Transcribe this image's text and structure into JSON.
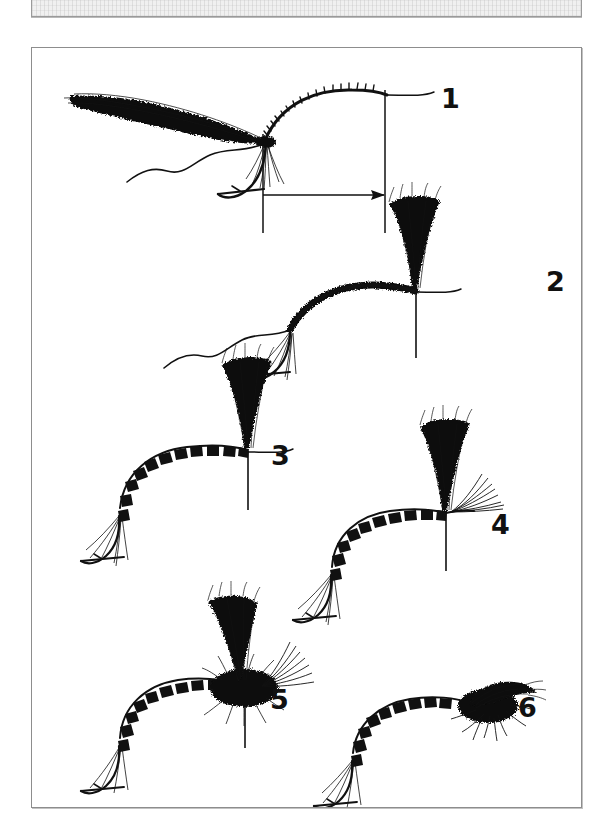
{
  "page": {
    "background_color": "#ffffff",
    "type": "scanned-book-page"
  },
  "top_block": {
    "name": "cropped-text-block",
    "fill_color": "#f0f0f0",
    "border_color": "#9a9a9a",
    "text": ""
  },
  "figure": {
    "title": "",
    "border_color": "#8d8d8d",
    "background_color": "#ffffff",
    "ink_color": "#111111",
    "steps": [
      {
        "number": "1",
        "label": "1",
        "caption": "",
        "description": "Hook in vise with thread base; deer-hair wing bundle tied in facing rearward; measuring guide lines and arrow show wing length relative to hook shank",
        "has_measure_arrow": true
      },
      {
        "number": "2",
        "label": "2",
        "caption": "",
        "description": "Wing bundle stood upright and posted; thread wraps build a dense band along the shank"
      },
      {
        "number": "3",
        "label": "3",
        "caption": "",
        "description": "Segmented banded body wrapped from the bend forward to the upright wing post"
      },
      {
        "number": "4",
        "label": "4",
        "caption": "",
        "description": "Hackle fibers tied in at the head ahead of the upright wing post"
      },
      {
        "number": "5",
        "label": "5",
        "caption": "",
        "description": "Dubbed thorax built around the base of the wing post"
      },
      {
        "number": "6",
        "label": "6",
        "caption": "",
        "description": "Finished fly with the wing swept back over the thorax and head whip-finished"
      }
    ]
  }
}
